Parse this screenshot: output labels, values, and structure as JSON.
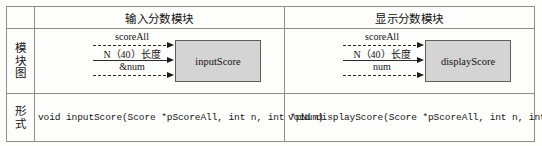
{
  "table": {
    "rows": [
      {
        "label_chars": [],
        "label": ""
      },
      {
        "label_chars": [
          "模",
          "块",
          "图"
        ],
        "label": "模块图"
      },
      {
        "label_chars": [
          "形",
          "式"
        ],
        "label": "形式"
      }
    ]
  },
  "modules": [
    {
      "title": "输入分数模块",
      "box_label": "inputScore",
      "arrows": [
        {
          "caption": "scoreAll",
          "style": "dashed"
        },
        {
          "caption": "N（40）长度",
          "style": "solid"
        },
        {
          "caption": "&num",
          "style": "dashed"
        }
      ],
      "signature": "void inputScore(Score *pScoreAll, int n, int *pNum)"
    },
    {
      "title": "显示分数模块",
      "box_label": "displayScore",
      "arrows": [
        {
          "caption": "scoreAll",
          "style": "dashed"
        },
        {
          "caption": "N（40）长度",
          "style": "solid"
        },
        {
          "caption": "num",
          "style": "dashed"
        }
      ],
      "signature": "void displayScore(Score *pScoreAll, int n, int num)"
    }
  ],
  "colors": {
    "border": "#8e8e8e",
    "box_fill": "#d4d4d4",
    "box_border": "#5d5d5d",
    "text": "#151515",
    "page_background": "#fdfdfb"
  }
}
